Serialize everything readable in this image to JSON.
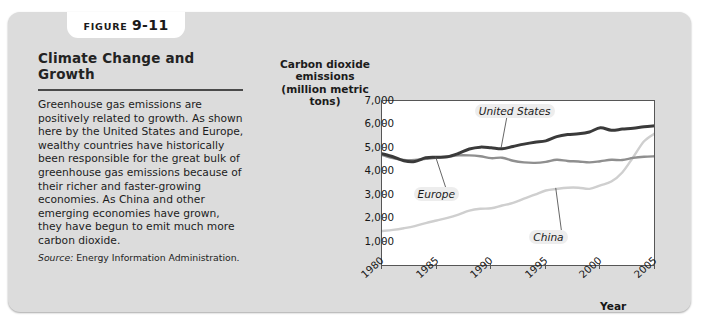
{
  "figure": {
    "tab_word": "FIGURE",
    "tab_number": "9-11",
    "heading": "Climate Change and Growth",
    "body": "Greenhouse gas emissions are positively related to growth. As shown here by the United States and Europe, wealthy countries have historically been responsible for the great bulk of greenhouse gas emissions because of their richer and faster-growing economies. As China and other emerging economies have grown, they have begun to emit much more carbon dioxide.",
    "source_word": "Source:",
    "source_text": "Energy Information Administration.",
    "panel_color": "#dcdcdc",
    "heading_color": "#232323"
  },
  "chart_data": {
    "type": "line",
    "title": "",
    "ylabel": "Carbon dioxide emissions (million metric tons)",
    "ylabel_lines": [
      "Carbon dioxide",
      "emissions",
      "(million metric tons)"
    ],
    "xlabel": "Year",
    "ylim": [
      0,
      7000
    ],
    "xlim": [
      1980,
      2005
    ],
    "ytick_labels": [
      "7,000",
      "6,000",
      "5,000",
      "4,000",
      "3,000",
      "2,000",
      "1,000"
    ],
    "ytick_values": [
      7000,
      6000,
      5000,
      4000,
      3000,
      2000,
      1000
    ],
    "xtick_labels": [
      "1980",
      "1985",
      "1990",
      "1995",
      "2000",
      "2005"
    ],
    "xtick_values": [
      1980,
      1985,
      1990,
      1995,
      2000,
      2005
    ],
    "grid": false,
    "legend": "inline-annotations",
    "x": [
      1980,
      1981,
      1982,
      1983,
      1984,
      1985,
      1986,
      1987,
      1988,
      1989,
      1990,
      1991,
      1992,
      1993,
      1994,
      1995,
      1996,
      1997,
      1998,
      1999,
      2000,
      2001,
      2002,
      2003,
      2004,
      2005
    ],
    "series": [
      {
        "name": "United States",
        "color": "#3a3a3a",
        "label_x": 1990.6,
        "label_y": 6550,
        "values": [
          4750,
          4620,
          4450,
          4420,
          4580,
          4600,
          4620,
          4760,
          4950,
          5030,
          5000,
          4960,
          5060,
          5160,
          5240,
          5300,
          5480,
          5570,
          5600,
          5680,
          5860,
          5750,
          5800,
          5840,
          5900,
          5940
        ]
      },
      {
        "name": "Europe",
        "color": "#8f8f8f",
        "label_x": 1985.0,
        "label_y": 2980,
        "values": [
          4700,
          4560,
          4480,
          4480,
          4530,
          4580,
          4620,
          4680,
          4680,
          4640,
          4560,
          4580,
          4450,
          4380,
          4360,
          4400,
          4490,
          4440,
          4420,
          4380,
          4430,
          4490,
          4480,
          4570,
          4620,
          4640
        ]
      },
      {
        "name": "China",
        "color": "#cfcfcf",
        "label_x": 1995.6,
        "label_y": 1150,
        "values": [
          1450,
          1500,
          1570,
          1660,
          1790,
          1900,
          2010,
          2150,
          2320,
          2400,
          2420,
          2540,
          2650,
          2830,
          3000,
          3180,
          3250,
          3300,
          3300,
          3250,
          3400,
          3560,
          3950,
          4600,
          5280,
          5620
        ]
      }
    ]
  }
}
